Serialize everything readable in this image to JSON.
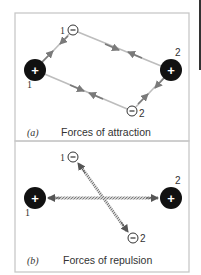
{
  "figure": {
    "panels": [
      {
        "id": "a",
        "letter": "(a)",
        "caption": "Forces of attraction",
        "charges": [
          {
            "sign": "+",
            "label": "1"
          },
          {
            "sign": "-",
            "label": "1"
          },
          {
            "sign": "+",
            "label": "2"
          },
          {
            "sign": "-",
            "label": "2"
          }
        ],
        "force_type": "attraction"
      },
      {
        "id": "b",
        "letter": "(b)",
        "caption": "Forces of repulsion",
        "charges": [
          {
            "sign": "+",
            "label": "1"
          },
          {
            "sign": "-",
            "label": "1"
          },
          {
            "sign": "+",
            "label": "2"
          },
          {
            "sign": "-",
            "label": "2"
          }
        ],
        "force_type": "repulsion"
      }
    ],
    "colors": {
      "border": "#c8c8c8",
      "attraction_line": "#bdbdbd",
      "arrowhead": "#7a7a7a",
      "repulsion_line": "#8a8a8a",
      "positive_fill": "#111111",
      "negative_stroke": "#333333"
    }
  }
}
